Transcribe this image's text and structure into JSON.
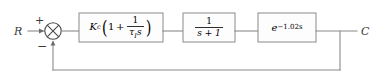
{
  "diagram": {
    "type": "control-system-block-diagram",
    "canvas": {
      "width": 377,
      "height": 81,
      "background": "#ffffff"
    },
    "colors": {
      "wire": "#8a8a8a",
      "block_border": "#8a8a8a",
      "block_fill": "#fdfdfd",
      "text": "#2e2e2e",
      "summing_junction": "#4a4a4a"
    },
    "input": {
      "label": "R",
      "name": "setpoint"
    },
    "output": {
      "label": "C",
      "name": "controlled-variable"
    },
    "summing_junction": {
      "name": "summing-junction",
      "shape": "circle-with-cross",
      "signs": {
        "input": "+",
        "feedback": "−"
      }
    },
    "blocks": [
      {
        "id": "controller",
        "name": "pi-controller-block",
        "kind": "transfer-function",
        "gain_symbol": "K",
        "gain_subscript": "c",
        "expression_plain": "K_c (1 + 1/(τ_I s))",
        "numerator": "1",
        "denominator_symbol": "τ",
        "denominator_subscript": "I",
        "denominator_variable": "s",
        "plus_sign": "+",
        "one": "1",
        "paren_open": "(",
        "paren_close": ")"
      },
      {
        "id": "process",
        "name": "first-order-process-block",
        "kind": "transfer-function",
        "expression_plain": "1/(s + 1)",
        "numerator": "1",
        "denominator": "s + 1"
      },
      {
        "id": "delay",
        "name": "time-delay-block",
        "kind": "transport-delay",
        "expression_plain": "e^(-1.02 s)",
        "base": "e",
        "exponent": "−1.02s",
        "delay_value": 1.02
      }
    ],
    "feedback": {
      "name": "unity-feedback-path",
      "gain": 1,
      "sign": "−",
      "description": "negative unity feedback from output to summing junction"
    }
  }
}
